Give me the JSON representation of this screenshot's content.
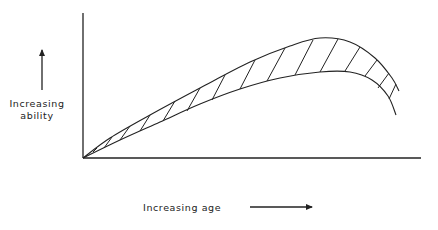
{
  "diagram": {
    "type": "conceptual-curve",
    "y_axis_label_line1": "Increasing",
    "y_axis_label_line2": "ability",
    "x_axis_label": "Increasing age",
    "colors": {
      "line": "#222222",
      "background": "#ffffff"
    },
    "axes": {
      "origin": [
        83,
        158
      ],
      "y_top": [
        83,
        13
      ],
      "x_right": [
        421,
        158
      ]
    },
    "upper_curve": [
      [
        83,
        158
      ],
      [
        110,
        138
      ],
      [
        150,
        115
      ],
      [
        200,
        88
      ],
      [
        250,
        62
      ],
      [
        290,
        46
      ],
      [
        320,
        38
      ],
      [
        350,
        42
      ],
      [
        375,
        58
      ],
      [
        392,
        78
      ],
      [
        399,
        91
      ]
    ],
    "lower_curve": [
      [
        83,
        158
      ],
      [
        120,
        140
      ],
      [
        160,
        122
      ],
      [
        200,
        104
      ],
      [
        240,
        89
      ],
      [
        280,
        78
      ],
      [
        320,
        72
      ],
      [
        350,
        72
      ],
      [
        372,
        80
      ],
      [
        388,
        96
      ],
      [
        396,
        115
      ]
    ],
    "hatch_lines": [
      [
        [
          97,
          148
        ],
        [
          93,
          152
        ]
      ],
      [
        [
          112,
          137
        ],
        [
          104,
          148
        ]
      ],
      [
        [
          130,
          126
        ],
        [
          120,
          140
        ]
      ],
      [
        [
          150,
          115
        ],
        [
          140,
          131
        ]
      ],
      [
        [
          175,
          101
        ],
        [
          163,
          121
        ]
      ],
      [
        [
          200,
          88
        ],
        [
          187,
          111
        ]
      ],
      [
        [
          225,
          75
        ],
        [
          212,
          100
        ]
      ],
      [
        [
          255,
          60
        ],
        [
          240,
          89
        ]
      ],
      [
        [
          285,
          48
        ],
        [
          267,
          81
        ]
      ],
      [
        [
          313,
          40
        ],
        [
          295,
          75
        ]
      ],
      [
        [
          338,
          39
        ],
        [
          320,
          72
        ]
      ],
      [
        [
          360,
          47
        ],
        [
          345,
          71
        ]
      ],
      [
        [
          377,
          60
        ],
        [
          365,
          76
        ]
      ],
      [
        [
          389,
          73
        ],
        [
          378,
          88
        ]
      ],
      [
        [
          396,
          84
        ],
        [
          389,
          99
        ]
      ]
    ],
    "y_arrow": {
      "from": [
        42,
        90
      ],
      "to": [
        42,
        50
      ]
    },
    "x_arrow": {
      "from": [
        250,
        207
      ],
      "to": [
        312,
        207
      ]
    }
  }
}
